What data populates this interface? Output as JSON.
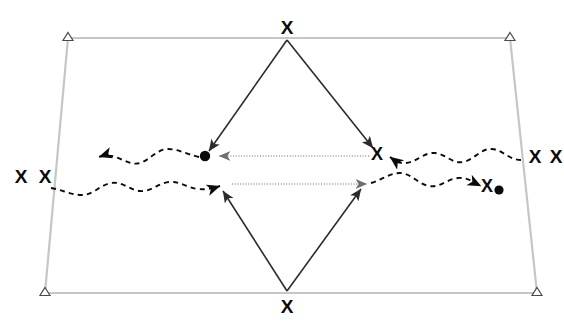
{
  "figure": {
    "title": "",
    "canvas": {
      "width": 564,
      "height": 333,
      "background": "#ffffff"
    },
    "colors": {
      "boundary": "#c6c6c6",
      "solid_arrow": "#2b2b2b",
      "dashed_wavy": "#0b0b0b",
      "dotted_arrow": "#9a9a9a",
      "marker": "#0b0b0b",
      "triangle_stroke": "#3a3a3a",
      "triangle_fill": "#ffffff"
    },
    "boundary": {
      "name": "quadrilateral-boundary",
      "shape": "trapezoid",
      "stroke_width": 2.2,
      "corners": [
        {
          "id": "top-left",
          "x": 68,
          "y": 38,
          "marker": "open-triangle"
        },
        {
          "id": "top-right",
          "x": 510,
          "y": 38,
          "marker": "open-triangle"
        },
        {
          "id": "bottom-right",
          "x": 537,
          "y": 293,
          "marker": "open-triangle"
        },
        {
          "id": "bottom-left",
          "x": 45,
          "y": 293,
          "marker": "open-triangle"
        }
      ]
    },
    "diamond": {
      "name": "diamond-solid-arrows",
      "stroke_width": 1.6,
      "top_vertex": {
        "x": 287,
        "y": 40
      },
      "bottom_vertex": {
        "x": 287,
        "y": 291
      },
      "left_target": {
        "x": 205,
        "y": 156
      },
      "right_target": {
        "x": 376,
        "y": 153
      },
      "edges": [
        {
          "id": "top-left-edge",
          "from": "top_vertex",
          "to": "left_target",
          "arrow": "at-end"
        },
        {
          "id": "top-right-edge",
          "from": "top_vertex",
          "to": "right_target",
          "arrow": "at-end"
        },
        {
          "id": "bottom-left-edge",
          "from": "bottom_vertex",
          "to": "left_lower",
          "arrow": "at-end"
        },
        {
          "id": "bottom-right-edge",
          "from": "bottom_vertex",
          "to": "right_lower",
          "arrow": "at-end"
        }
      ],
      "lower_left_target": {
        "x": 219,
        "y": 186
      },
      "lower_right_target": {
        "x": 364,
        "y": 184
      }
    },
    "wavy_lines": [
      {
        "id": "upper-wavy-line",
        "direction": "leftward",
        "style": "dashed",
        "arrow": "left-end",
        "start_x": 200,
        "end_x": 93,
        "y": 157
      },
      {
        "id": "upper-wavy-line-right",
        "direction": "leftward",
        "style": "dashed",
        "arrow": "left-end",
        "start_x": 520,
        "end_x": 384,
        "y": 156
      },
      {
        "id": "lower-wavy-line",
        "direction": "rightward",
        "style": "dashed",
        "arrow": "right-end",
        "start_x": 50,
        "end_x": 226,
        "y": 187
      },
      {
        "id": "lower-wavy-line-right",
        "direction": "rightward",
        "style": "dashed",
        "arrow": "right-end",
        "start_x": 370,
        "end_x": 482,
        "y": 185
      }
    ],
    "dotted_arrows": [
      {
        "id": "upper-dotted-arrow",
        "direction": "leftward",
        "from_x": 369,
        "to_x": 216,
        "y": 156
      },
      {
        "id": "lower-dotted-arrow",
        "direction": "rightward",
        "from_x": 232,
        "to_x": 370,
        "y": 184
      }
    ],
    "markers": [
      {
        "id": "marker-top-vertex",
        "type": "x",
        "x": 287,
        "y": 28,
        "size": 17,
        "label": "X"
      },
      {
        "id": "marker-bottom-vertex",
        "type": "x",
        "x": 287,
        "y": 307,
        "size": 17,
        "label": "X"
      },
      {
        "id": "marker-left-dot",
        "type": "dot",
        "x": 205,
        "y": 156,
        "radius": 5
      },
      {
        "id": "marker-right-x-inner",
        "type": "x",
        "x": 377,
        "y": 153,
        "size": 16,
        "label": "X"
      },
      {
        "id": "marker-left-outer-x-1",
        "type": "x",
        "x": 21,
        "y": 177,
        "size": 17,
        "label": "X"
      },
      {
        "id": "marker-left-outer-x-2",
        "type": "x",
        "x": 45,
        "y": 177,
        "size": 17,
        "label": "X"
      },
      {
        "id": "marker-right-outer-x-1",
        "type": "x",
        "x": 535,
        "y": 157,
        "size": 17,
        "label": "X"
      },
      {
        "id": "marker-right-outer-x-2",
        "type": "x",
        "x": 556,
        "y": 157,
        "size": 17,
        "label": "X"
      },
      {
        "id": "marker-right-inner-x-end",
        "type": "x",
        "x": 487,
        "y": 186,
        "size": 16,
        "label": "X"
      },
      {
        "id": "marker-right-inner-dot",
        "type": "dot",
        "x": 498,
        "y": 190,
        "radius": 4.5
      }
    ]
  }
}
